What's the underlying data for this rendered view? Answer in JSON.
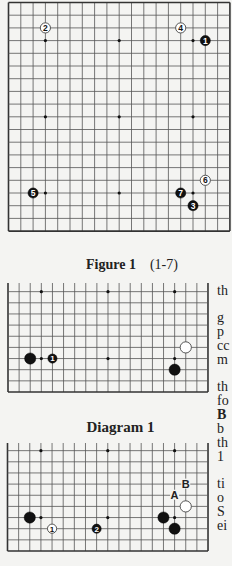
{
  "figure1": {
    "caption_label": "Figure 1",
    "caption_range": "(1-7)",
    "stones": [
      {
        "color": "white",
        "label": "2",
        "col": 3,
        "row": 2
      },
      {
        "color": "white",
        "label": "4",
        "col": 14,
        "row": 2
      },
      {
        "color": "black",
        "label": "1",
        "col": 16,
        "row": 3
      },
      {
        "color": "black",
        "label": "5",
        "col": 2,
        "row": 15
      },
      {
        "color": "black",
        "label": "7",
        "col": 14,
        "row": 15
      },
      {
        "color": "black",
        "label": "3",
        "col": 15,
        "row": 16
      },
      {
        "color": "white",
        "label": "6",
        "col": 16,
        "row": 14
      }
    ]
  },
  "diagram1": {
    "caption": "Diagram 1",
    "stones": [
      {
        "color": "black",
        "label": "",
        "col": 2,
        "row": 15
      },
      {
        "color": "black",
        "label": "1",
        "col": 4,
        "row": 15
      },
      {
        "color": "white",
        "label": "",
        "col": 16,
        "row": 14
      },
      {
        "color": "black",
        "label": "",
        "col": 15,
        "row": 16
      }
    ]
  },
  "diagram2": {
    "stones": [
      {
        "color": "black",
        "label": "",
        "col": 2,
        "row": 15
      },
      {
        "color": "white",
        "label": "1",
        "col": 4,
        "row": 16
      },
      {
        "color": "black",
        "label": "2",
        "col": 8,
        "row": 16
      },
      {
        "color": "black",
        "label": "",
        "col": 14,
        "row": 15
      },
      {
        "color": "black",
        "label": "",
        "col": 15,
        "row": 16
      },
      {
        "color": "white",
        "label": "",
        "col": 16,
        "row": 14
      }
    ],
    "markers": [
      {
        "label": "A",
        "col": 15,
        "row": 13
      },
      {
        "label": "B",
        "col": 16,
        "row": 12
      }
    ]
  },
  "side_text": [
    {
      "text": "th",
      "y": 284,
      "bold": false
    },
    {
      "text": "g",
      "y": 311,
      "bold": false
    },
    {
      "text": "p",
      "y": 325,
      "bold": false
    },
    {
      "text": "cc",
      "y": 339,
      "bold": false
    },
    {
      "text": "m",
      "y": 353,
      "bold": false
    },
    {
      "text": "th",
      "y": 380,
      "bold": false
    },
    {
      "text": "fo",
      "y": 394,
      "bold": false
    },
    {
      "text": "B",
      "y": 408,
      "bold": true
    },
    {
      "text": "b",
      "y": 422,
      "bold": false
    },
    {
      "text": "th",
      "y": 436,
      "bold": false
    },
    {
      "text": "1",
      "y": 450,
      "bold": false
    },
    {
      "text": "ti",
      "y": 477,
      "bold": false
    },
    {
      "text": "o",
      "y": 491,
      "bold": false
    },
    {
      "text": "S",
      "y": 505,
      "bold": false
    },
    {
      "text": "ei",
      "y": 519,
      "bold": false
    }
  ],
  "colors": {
    "grid": "#555555",
    "edge": "#333333",
    "black_stone": "#111111",
    "white_stone": "#ffffff"
  }
}
